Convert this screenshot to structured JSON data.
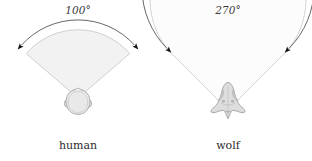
{
  "figure": {
    "type": "diagram",
    "background_color": "#ffffff",
    "panels": [
      {
        "id": "human",
        "caption": "human",
        "angle_label": "100°",
        "angle_degrees": 100,
        "caption_position": {
          "x": 78,
          "y": 146
        },
        "angle_label_position": {
          "x": 78,
          "y": 13
        },
        "vision_cone": {
          "fill_color": "#f2f2f2",
          "stroke_color": "#c8c8c8",
          "apex": {
            "x": 78,
            "y": 98
          },
          "radius": 68,
          "start_angle_deg": 230,
          "end_angle_deg": 310
        },
        "arrow_arc": {
          "stroke_color": "#4a4a4a",
          "arrowhead_color": "#111111",
          "radius": 76,
          "start_angle_deg": 222,
          "end_angle_deg": 318
        },
        "head": {
          "shape": "human-head-top-view",
          "fill_color": "#e6e6e6",
          "stroke_color": "#9a9a9a",
          "center": {
            "x": 78,
            "y": 103
          },
          "width": 22,
          "height": 28
        }
      },
      {
        "id": "wolf",
        "caption": "wolf",
        "angle_label": "270°",
        "angle_degrees": 270,
        "caption_position": {
          "x": 228,
          "y": 146
        },
        "angle_label_position": {
          "x": 228,
          "y": 13
        },
        "vision_cone": {
          "fill_color": "#fbfbfb",
          "stroke_color": "#cfcfcf",
          "apex": {
            "x": 228,
            "y": 110
          },
          "radius": 78,
          "start_angle_deg": 135,
          "end_angle_deg": 405
        },
        "arrow_arc": {
          "stroke_color": "#4a4a4a",
          "arrowhead_color": "#111111",
          "radius": 86,
          "start_angle_deg": 130,
          "end_angle_deg": 410
        },
        "head": {
          "shape": "wolf-head-top-view",
          "fill_color": "#dcdcdc",
          "stroke_color": "#999999",
          "center": {
            "x": 228,
            "y": 105
          },
          "width": 46,
          "height": 42
        }
      }
    ]
  }
}
